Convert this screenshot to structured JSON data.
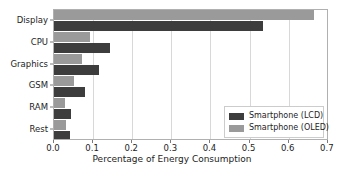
{
  "chart_data": {
    "type": "bar",
    "orientation": "horizontal",
    "title": "",
    "xlabel": "Percentage of Energy Consumption",
    "ylabel": "",
    "xlim": [
      0.0,
      0.703
    ],
    "xticks": [
      "0.0",
      "0.1",
      "0.2",
      "0.3",
      "0.4",
      "0.5",
      "0.6",
      "0.7"
    ],
    "xtick_values": [
      0.0,
      0.1,
      0.2,
      0.3,
      0.4,
      0.5,
      0.6,
      0.7
    ],
    "categories": [
      "Display",
      "CPU",
      "Graphics",
      "GSM",
      "RAM",
      "Rest"
    ],
    "grid": true,
    "legend_position": "lower right",
    "series": [
      {
        "name": "Smartphone (LCD)",
        "color": "#3d3d3d",
        "values": [
          0.535,
          0.142,
          0.115,
          0.079,
          0.043,
          0.042
        ]
      },
      {
        "name": "Smartphone (OLED)",
        "color": "#9a9a9a",
        "values": [
          0.665,
          0.092,
          0.072,
          0.051,
          0.027,
          0.03
        ]
      }
    ]
  },
  "legend": {
    "items": [
      {
        "label": "Smartphone (LCD)",
        "color": "#3d3d3d"
      },
      {
        "label": "Smartphone (OLED)",
        "color": "#9a9a9a"
      }
    ]
  },
  "axis": {
    "x_title": "Percentage of Energy Consumption"
  }
}
